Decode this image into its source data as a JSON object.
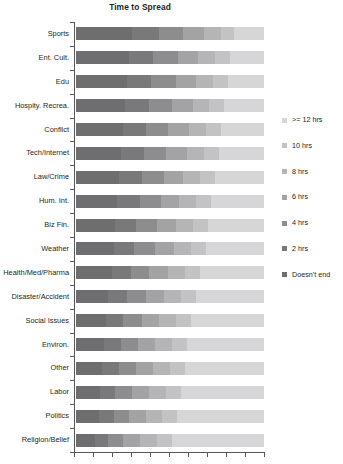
{
  "chart_data": {
    "type": "bar",
    "subtype": "stacked-horizontal-100pct",
    "title": "Time to Spread",
    "xlabel": "",
    "ylabel": "",
    "xlim": [
      0,
      100
    ],
    "grid": false,
    "legend_position": "right",
    "axis_color": "#58585a",
    "x_tick_count": 11,
    "categories": [
      "Sports",
      "Ent. Cult.",
      "Edu",
      "Hospity. Recrea.",
      "Conflict",
      "Tech/Internet",
      "Law/Crime",
      "Hum. Int.",
      "Biz Fin.",
      "Weather",
      "Health/Med/Pharma",
      "Disaster/Accident",
      "Social Issues",
      "Environ.",
      "Other",
      "Labor",
      "Politics",
      "Religion/Belief"
    ],
    "series": [
      {
        "name": "Doesn't end",
        "color": "#6e6e70",
        "values": [
          30,
          28,
          27,
          26,
          25,
          24,
          23,
          22,
          21,
          20,
          19,
          17,
          16,
          15,
          14,
          13,
          12,
          10
        ]
      },
      {
        "name": "2 hrs",
        "color": "#79797b",
        "values": [
          14,
          13,
          13,
          13,
          12,
          12,
          12,
          12,
          11,
          11,
          10,
          10,
          9,
          9,
          9,
          8,
          8,
          7
        ]
      },
      {
        "name": "4 hrs",
        "color": "#8d8d8f",
        "values": [
          13,
          13,
          13,
          12,
          12,
          12,
          12,
          11,
          11,
          11,
          10,
          10,
          10,
          9,
          9,
          9,
          8,
          8
        ]
      },
      {
        "name": "6 hrs",
        "color": "#a3a3a5",
        "values": [
          11,
          11,
          11,
          11,
          11,
          11,
          10,
          10,
          10,
          10,
          10,
          10,
          9,
          9,
          9,
          9,
          9,
          9
        ]
      },
      {
        "name": "8 hrs",
        "color": "#b5b5b7",
        "values": [
          9,
          9,
          9,
          9,
          9,
          9,
          9,
          9,
          9,
          9,
          9,
          9,
          9,
          9,
          9,
          9,
          9,
          9
        ]
      },
      {
        "name": "10 hrs",
        "color": "#c3c3c5",
        "values": [
          7,
          8,
          8,
          8,
          8,
          8,
          8,
          8,
          8,
          8,
          8,
          8,
          8,
          8,
          8,
          8,
          8,
          8
        ]
      },
      {
        "name": ">= 12 hrs",
        "color": "#d6d6d8",
        "values": [
          16,
          18,
          19,
          21,
          23,
          24,
          26,
          28,
          30,
          31,
          34,
          36,
          39,
          41,
          42,
          44,
          46,
          49
        ]
      }
    ],
    "legend_entries": [
      {
        "label": ">= 12 hrs",
        "color": "#d6d6d8"
      },
      {
        "label": "10 hrs",
        "color": "#c3c3c5"
      },
      {
        "label": "8 hrs",
        "color": "#b5b5b7"
      },
      {
        "label": "6 hrs",
        "color": "#a3a3a5"
      },
      {
        "label": "4 hrs",
        "color": "#8d8d8f"
      },
      {
        "label": "2 hrs",
        "color": "#79797b"
      },
      {
        "label": "Doesn't end",
        "color": "#6e6e70"
      }
    ]
  }
}
